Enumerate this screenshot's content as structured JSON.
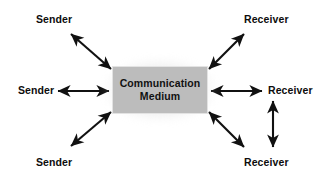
{
  "diagram": {
    "type": "communication-model",
    "canvas": {
      "width": 326,
      "height": 181,
      "background": "#ffffff"
    },
    "center_node": {
      "label": "Communication\nMedium",
      "line1": "Communication",
      "line2": "Medium",
      "fill_color": "#bcbcbc",
      "border_color": "#e3e3e3",
      "text_color": "#111111",
      "x": 112,
      "y": 66,
      "width": 96,
      "height": 48
    },
    "senders": [
      {
        "id": "sender-top-left",
        "label": "Sender",
        "x": 36,
        "y": 14,
        "align": "left"
      },
      {
        "id": "sender-middle-left",
        "label": "Sender",
        "x": 18,
        "y": 85,
        "align": "left"
      },
      {
        "id": "sender-bottom-left",
        "label": "Sender",
        "x": 36,
        "y": 157,
        "align": "left"
      }
    ],
    "receivers": [
      {
        "id": "receiver-top-right",
        "label": "Receiver",
        "x": 244,
        "y": 14,
        "align": "left"
      },
      {
        "id": "receiver-middle-right",
        "label": "Receiver",
        "x": 268,
        "y": 85,
        "align": "left"
      },
      {
        "id": "receiver-bottom-right",
        "label": "Receiver",
        "x": 244,
        "y": 157,
        "align": "left"
      }
    ],
    "connectors": [
      {
        "id": "connector-sender-top-left",
        "style": "double-headed-arrow",
        "from": [
          70,
          33
        ],
        "to": [
          112,
          70
        ],
        "color": "#111111"
      },
      {
        "id": "connector-sender-middle-left",
        "style": "double-headed-arrow",
        "from": [
          57,
          91
        ],
        "to": [
          110,
          91
        ],
        "color": "#111111"
      },
      {
        "id": "connector-sender-bottom-left",
        "style": "double-headed-arrow",
        "from": [
          70,
          147
        ],
        "to": [
          112,
          111
        ],
        "color": "#111111"
      },
      {
        "id": "connector-receiver-top-right",
        "style": "double-headed-arrow",
        "from": [
          208,
          70
        ],
        "to": [
          245,
          33
        ],
        "color": "#111111"
      },
      {
        "id": "connector-receiver-middle-right",
        "style": "double-headed-arrow",
        "from": [
          210,
          91
        ],
        "to": [
          262,
          91
        ],
        "color": "#111111"
      },
      {
        "id": "connector-receiver-bottom-right",
        "style": "double-headed-arrow",
        "from": [
          208,
          111
        ],
        "to": [
          245,
          148
        ],
        "color": "#111111"
      },
      {
        "id": "connector-receiver-vertical",
        "style": "double-headed-arrow",
        "from": [
          273,
          100
        ],
        "to": [
          273,
          148
        ],
        "color": "#111111"
      }
    ]
  }
}
